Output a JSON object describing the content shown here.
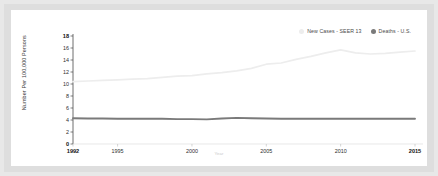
{
  "chart_data": {
    "type": "line",
    "title": "",
    "xlabel": "Year",
    "ylabel": "Number Per 100,000 Persons",
    "xlim": [
      1992,
      2015
    ],
    "ylim": [
      0,
      18
    ],
    "yticks": [
      0,
      2,
      4,
      6,
      8,
      10,
      12,
      14,
      16,
      18
    ],
    "xticks": [
      1992,
      1995,
      2000,
      2005,
      2010,
      2015
    ],
    "xtick_labels": [
      "1992",
      "1995",
      "2000",
      "2005",
      "2010",
      "2015"
    ],
    "ytick_labels": [
      "0",
      "2",
      "4",
      "6",
      "8",
      "10",
      "12",
      "14",
      "16",
      "18"
    ],
    "grid": false,
    "legend_position": "top-right",
    "x": [
      1992,
      1993,
      1994,
      1995,
      1996,
      1997,
      1998,
      1999,
      2000,
      2001,
      2002,
      2003,
      2004,
      2005,
      2006,
      2007,
      2008,
      2009,
      2010,
      2011,
      2012,
      2013,
      2014,
      2015
    ],
    "series": [
      {
        "name": "New Cases - SEER 13",
        "color": "#ededed",
        "marker": "square",
        "values": [
          10.4,
          10.5,
          10.6,
          10.7,
          10.8,
          10.9,
          11.1,
          11.3,
          11.4,
          11.7,
          11.9,
          12.2,
          12.6,
          13.3,
          13.5,
          14.1,
          14.6,
          15.2,
          15.7,
          15.2,
          15.0,
          15.1,
          15.3,
          15.5
        ]
      },
      {
        "name": "Deaths - U.S.",
        "color": "#7a7a7a",
        "marker": "circle",
        "values": [
          4.3,
          4.25,
          4.25,
          4.2,
          4.2,
          4.2,
          4.2,
          4.15,
          4.15,
          4.1,
          4.25,
          4.35,
          4.3,
          4.25,
          4.2,
          4.2,
          4.2,
          4.2,
          4.2,
          4.2,
          4.2,
          4.2,
          4.2,
          4.2
        ]
      }
    ]
  },
  "legend": {
    "items": [
      {
        "label": "New Cases - SEER 13",
        "color": "#ededed"
      },
      {
        "label": "Deaths - U.S.",
        "color": "#7a7a7a"
      }
    ]
  },
  "axes": {
    "y_title": "Number Per 100,000 Persons",
    "x_title": "Year"
  }
}
